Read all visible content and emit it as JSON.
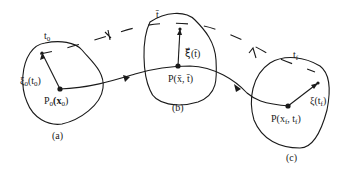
{
  "diagram": {
    "panels": [
      {
        "id": "a",
        "caption": "(a)",
        "time_label": "t",
        "time_sub": "0",
        "point_label": "P",
        "point_sub": "0",
        "point_arg": "(x",
        "point_arg_sub": "0",
        "point_arg_end": ")",
        "vector_label": "ξ",
        "vector_sub": "0",
        "vector_arg": "(t",
        "vector_arg_sub": "0",
        "vector_arg_end": ")"
      },
      {
        "id": "b",
        "caption": "(b)",
        "time_label": "t̄",
        "point_label": "P(x̄, t̄)",
        "vector_label": "ξ⃗(t̄)"
      },
      {
        "id": "c",
        "caption": "(c)",
        "time_label": "t",
        "time_sub": "f",
        "point_label": "P(x",
        "point_sub": "f",
        "point_mid": ", t",
        "point_mid_sub": "f",
        "point_end": ")",
        "vector_label": "ξ(t",
        "vector_sub": "f",
        "vector_end": ")"
      }
    ]
  }
}
